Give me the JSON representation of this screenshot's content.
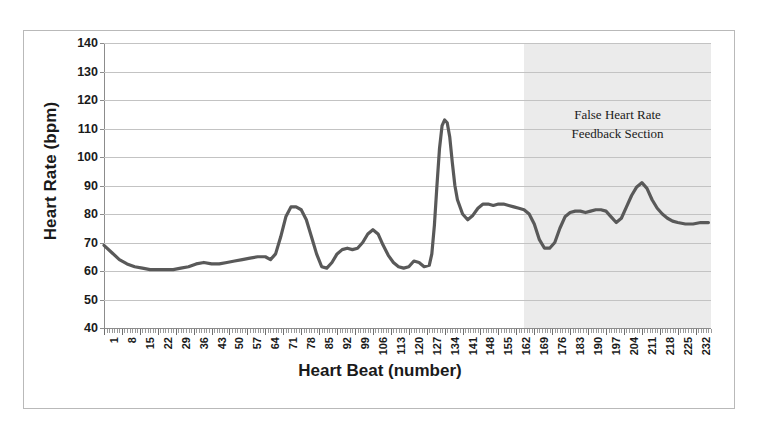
{
  "chart_data": {
    "type": "line",
    "title": "",
    "xlabel": "Heart Beat (number)",
    "ylabel": "Heart Rate (bpm)",
    "ylim": [
      40,
      140
    ],
    "ytick_step": 10,
    "yticks": [
      140,
      130,
      120,
      110,
      100,
      90,
      80,
      70,
      60,
      50,
      40
    ],
    "xlim": [
      1,
      238
    ],
    "xtick_step": 7,
    "xticks": [
      1,
      8,
      15,
      22,
      29,
      36,
      43,
      50,
      57,
      64,
      71,
      78,
      85,
      92,
      99,
      106,
      113,
      120,
      127,
      134,
      141,
      148,
      155,
      162,
      169,
      176,
      183,
      190,
      197,
      204,
      211,
      218,
      225,
      232
    ],
    "grid": true,
    "legend": "none",
    "series_name": "Heart Rate",
    "series_color": "#595959",
    "x": [
      1,
      4,
      7,
      10,
      13,
      16,
      19,
      22,
      25,
      28,
      31,
      34,
      37,
      40,
      43,
      46,
      49,
      52,
      55,
      58,
      61,
      64,
      66,
      68,
      70,
      72,
      74,
      76,
      78,
      80,
      82,
      84,
      86,
      88,
      90,
      92,
      94,
      96,
      98,
      100,
      102,
      104,
      106,
      108,
      110,
      112,
      114,
      116,
      118,
      120,
      122,
      124,
      126,
      128,
      129,
      130,
      131,
      132,
      133,
      134,
      135,
      136,
      137,
      138,
      139,
      141,
      143,
      145,
      147,
      149,
      151,
      153,
      155,
      157,
      159,
      161,
      163,
      165,
      167,
      169,
      171,
      173,
      175,
      177,
      179,
      181,
      183,
      185,
      187,
      189,
      191,
      193,
      195,
      197,
      199,
      201,
      203,
      205,
      207,
      209,
      211,
      213,
      215,
      217,
      219,
      221,
      223,
      225,
      228,
      231,
      234,
      237
    ],
    "y": [
      69,
      66.5,
      64,
      62.5,
      61.5,
      61,
      60.5,
      60.5,
      60.5,
      60.5,
      61,
      61.5,
      62.5,
      63,
      62.5,
      62.5,
      63,
      63.5,
      64,
      64.5,
      65,
      65,
      64,
      66,
      72,
      79,
      82.5,
      82.5,
      81.5,
      78,
      72,
      66,
      61.5,
      61,
      63,
      66,
      67.5,
      68,
      67.5,
      68,
      70,
      73,
      74.5,
      73,
      69,
      65.5,
      63,
      61.5,
      61,
      61.5,
      63.5,
      63,
      61.5,
      62,
      66,
      76,
      90,
      103,
      111,
      113,
      112,
      107,
      98,
      90,
      85,
      80,
      78,
      79.5,
      82,
      83.5,
      83.5,
      83,
      83.5,
      83.5,
      83,
      82.5,
      82,
      81.5,
      80,
      76.5,
      71,
      68,
      68,
      70,
      75,
      79,
      80.5,
      81,
      81,
      80.5,
      81,
      81.5,
      81.5,
      81,
      79,
      77,
      78.5,
      82.5,
      86.5,
      89.5,
      91,
      89,
      85,
      82,
      80,
      78.5,
      77.5,
      77,
      76.5,
      76.5,
      77,
      77
    ],
    "annotation": {
      "line1": "False Heart Rate",
      "line2": "Feedback Section",
      "shade_start_beat": 165,
      "shade_end_beat": 238,
      "shade_color": "#ebebeb"
    }
  }
}
